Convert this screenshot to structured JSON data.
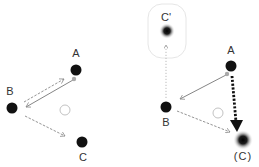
{
  "diagram": {
    "left_panel": {
      "nodes": [
        {
          "id": "A",
          "label": "A"
        },
        {
          "id": "B",
          "label": "B"
        },
        {
          "id": "C",
          "label": "C"
        }
      ],
      "edges": [
        {
          "from": "B",
          "to": "A",
          "style": "dashed"
        },
        {
          "from": "A",
          "to": "B",
          "style": "solid"
        },
        {
          "from": "B",
          "to": "C",
          "style": "dashed"
        }
      ]
    },
    "right_panel": {
      "nodes": [
        {
          "id": "Cprime",
          "label": "C'"
        },
        {
          "id": "A",
          "label": "A"
        },
        {
          "id": "B",
          "label": "B"
        },
        {
          "id": "C",
          "label": "(C)"
        }
      ],
      "edges": [
        {
          "from": "B",
          "to": "Cprime",
          "style": "dotted"
        },
        {
          "from": "A",
          "to": "B",
          "style": "solid"
        },
        {
          "from": "B",
          "to": "C",
          "style": "dashed"
        },
        {
          "from": "A",
          "to": "C",
          "style": "thick-dotted"
        }
      ]
    },
    "colors": {
      "node": "#111111",
      "edge": "#888888",
      "thick_edge": "#111111",
      "hollow": "#bbbbbb",
      "box": "#e6e6e6"
    }
  }
}
